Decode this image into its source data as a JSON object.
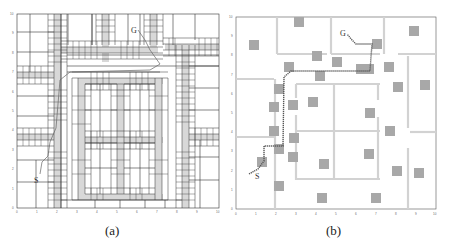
{
  "figure": {
    "panels": [
      {
        "id": "a",
        "caption": "(a)",
        "description": "Grid map decomposition with corridors and path from S to G",
        "start_label": "S",
        "goal_label": "G",
        "x_ticks": [
          "0",
          "1",
          "2",
          "3",
          "4",
          "5",
          "6",
          "7",
          "8",
          "9",
          "10"
        ],
        "y_ticks": [
          "0",
          "1",
          "2",
          "3",
          "4",
          "5",
          "6",
          "7",
          "8",
          "9",
          "10"
        ]
      },
      {
        "id": "b",
        "caption": "(b)",
        "description": "Map with walls, square obstacles and planned path from S to G",
        "start_label": "S",
        "goal_label": "G",
        "x_ticks": [
          "0",
          "1",
          "2",
          "3",
          "4",
          "5",
          "6",
          "7",
          "8",
          "9",
          "10"
        ],
        "y_ticks": [
          "0",
          "1",
          "2",
          "3",
          "4",
          "5",
          "6",
          "7",
          "8",
          "9",
          "10"
        ]
      }
    ],
    "colors": {
      "wall": "#d4d4d4",
      "obstacle": "#a8a8a8",
      "grid_line": "#444444",
      "path": "#555555",
      "axis": "#555555"
    }
  }
}
